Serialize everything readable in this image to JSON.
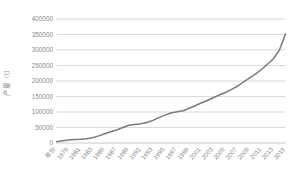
{
  "chart_data": {
    "type": "line",
    "title": "",
    "subtitle": "",
    "xlabel": "年份",
    "ylabel": "产量（t）",
    "ylim": [
      0,
      400000
    ],
    "ytick_values": [
      0,
      50000,
      100000,
      150000,
      200000,
      250000,
      300000,
      350000,
      400000
    ],
    "ytick_labels": [
      "0",
      "50000",
      "100000",
      "150000",
      "200000",
      "250000",
      "300000",
      "350000",
      "400000"
    ],
    "grid": true,
    "legend": false,
    "legend_position": "none",
    "line_color": "#7a7a7a",
    "grid_color": "#c9c9c9",
    "x": [
      1977,
      1978,
      1979,
      1980,
      1981,
      1982,
      1983,
      1984,
      1985,
      1986,
      1987,
      1988,
      1989,
      1990,
      1991,
      1992,
      1993,
      1994,
      1995,
      1996,
      1997,
      1998,
      1999,
      2000,
      2001,
      2002,
      2003,
      2004,
      2005,
      2006,
      2007,
      2008,
      2009,
      2010,
      2011,
      2012,
      2013,
      2014,
      2015
    ],
    "xtick_labels": [
      "年份",
      "1979",
      "1981",
      "1983",
      "1985",
      "1987",
      "1989",
      "1991",
      "1993",
      "1995",
      "1997",
      "1999",
      "2001",
      "2003",
      "2005",
      "2007",
      "2009",
      "2011",
      "2013",
      "2015"
    ],
    "values": [
      4000,
      7000,
      10000,
      11000,
      12000,
      14000,
      17000,
      23000,
      30000,
      36000,
      42000,
      50000,
      57000,
      60000,
      62000,
      66000,
      73000,
      82000,
      90000,
      97000,
      101000,
      104000,
      112000,
      120000,
      129000,
      137000,
      146000,
      155000,
      163000,
      172000,
      183000,
      196000,
      209000,
      222000,
      237000,
      254000,
      272000,
      300000,
      352000
    ],
    "series": [
      {
        "name": "产量",
        "values": [
          4000,
          7000,
          10000,
          11000,
          12000,
          14000,
          17000,
          23000,
          30000,
          36000,
          42000,
          50000,
          57000,
          60000,
          62000,
          66000,
          73000,
          82000,
          90000,
          97000,
          101000,
          104000,
          112000,
          120000,
          129000,
          137000,
          146000,
          155000,
          163000,
          172000,
          183000,
          196000,
          209000,
          222000,
          237000,
          254000,
          272000,
          300000,
          352000
        ]
      }
    ]
  }
}
